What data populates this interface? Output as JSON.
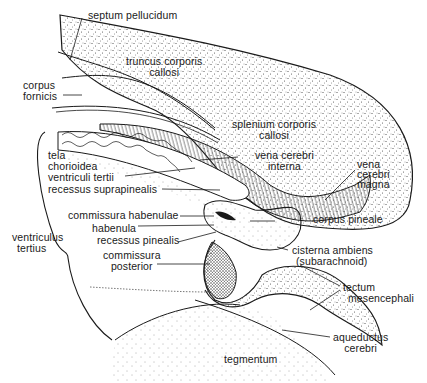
{
  "diagram": {
    "type": "anatomical-sagittal-section",
    "colors": {
      "ink": "#1a1a1a",
      "background": "#ffffff",
      "stipple": "#3a3a3a"
    },
    "labels": {
      "septum_pellucidum": {
        "lines": [
          "septum pellucidum"
        ]
      },
      "truncus_corporis_callosi": {
        "lines": [
          "truncus corporis",
          "callosi"
        ]
      },
      "corpus_fornicis": {
        "lines": [
          "corpus",
          "fornicis"
        ]
      },
      "splenium_corporis_callosi": {
        "lines": [
          "splenium corporis",
          "callosi"
        ]
      },
      "vena_cerebri_interna": {
        "lines": [
          "vena cerebri",
          "interna"
        ]
      },
      "vena_cerebri_magna": {
        "lines": [
          "vena",
          "cerebri",
          "magna"
        ]
      },
      "tela_chorioidea": {
        "lines": [
          "tela",
          "chorioidea",
          "ventriculi tertii"
        ]
      },
      "recessus_suprapinealis": {
        "lines": [
          "recessus suprapinealis"
        ]
      },
      "commissura_habenulae": {
        "lines": [
          "commissura habenulae"
        ]
      },
      "habenula": {
        "lines": [
          "habenula"
        ]
      },
      "recessus_pinealis": {
        "lines": [
          "recessus pinealis"
        ]
      },
      "corpus_pineale": {
        "lines": [
          "corpus pineale"
        ]
      },
      "ventriculus_tertius": {
        "lines": [
          "ventriculus",
          "tertius"
        ]
      },
      "commissura_posterior": {
        "lines": [
          "commissura",
          "posterior"
        ]
      },
      "cisterna_ambiens": {
        "lines": [
          "cisterna ambiens",
          "(subarachnoid)"
        ]
      },
      "tectum_mesencephali": {
        "lines": [
          "tectum",
          "mesencephali"
        ]
      },
      "aqueductus_cerebri": {
        "lines": [
          "aqueductus",
          "cerebri"
        ]
      },
      "tegmentum": {
        "lines": [
          "tegmentum"
        ]
      }
    }
  }
}
